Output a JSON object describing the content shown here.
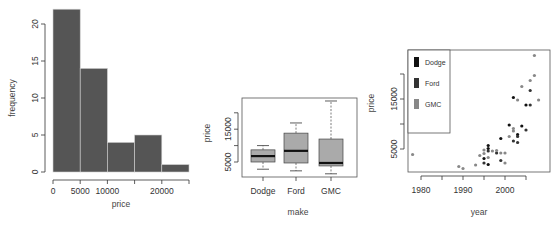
{
  "chart_data": [
    {
      "type": "bar",
      "subtype": "histogram",
      "title": "",
      "xlabel": "price",
      "ylabel": "frequency",
      "bins": [
        [
          0,
          5000
        ],
        [
          5000,
          10000
        ],
        [
          10000,
          15000
        ],
        [
          15000,
          20000
        ],
        [
          20000,
          25000
        ]
      ],
      "values": [
        22,
        14,
        4,
        5,
        1
      ],
      "xticks": [
        0,
        5000,
        10000,
        20000
      ],
      "xtick_marks": [
        0,
        5000,
        10000,
        15000,
        20000,
        25000
      ],
      "yticks": [
        0,
        5,
        10,
        15,
        20
      ],
      "xlim": [
        0,
        25000
      ],
      "ylim": [
        0,
        22
      ],
      "bar_color": "#555555",
      "grid": false
    },
    {
      "type": "boxplot",
      "title": "",
      "xlabel": "make",
      "ylabel": "price",
      "categories": [
        "Dodge",
        "Ford",
        "GMC"
      ],
      "boxes": [
        {
          "name": "Dodge",
          "whisker_low": 2800,
          "q1": 5000,
          "median": 6800,
          "q3": 8700,
          "whisker_high": 10000
        },
        {
          "name": "Ford",
          "whisker_low": 2300,
          "q1": 4700,
          "median": 8400,
          "q3": 13800,
          "whisker_high": 16900
        },
        {
          "name": "GMC",
          "whisker_low": 1400,
          "q1": 3800,
          "median": 4700,
          "q3": 12000,
          "whisker_high": 23600
        }
      ],
      "yticks_labeled": [
        5000,
        15000
      ],
      "ytick_marks": [
        5000,
        10000,
        15000,
        20000
      ],
      "box_color": "#aaaaaa",
      "grid": false
    },
    {
      "type": "scatter",
      "title": "",
      "xlabel": "year",
      "ylabel": "price",
      "xticks": [
        1980,
        1990,
        2000
      ],
      "xtick_marks": [
        1980,
        1985,
        1990,
        1995,
        2000,
        2005
      ],
      "yticks_labeled": [
        5000,
        15000
      ],
      "ytick_marks": [
        5000,
        10000,
        15000,
        20000
      ],
      "legend": {
        "position": "top-left",
        "entries": [
          "Dodge",
          "Ford",
          "GMC"
        ]
      },
      "series": [
        {
          "name": "Dodge",
          "color": "#111111",
          "points": [
            [
              1995,
              3100
            ],
            [
              1996,
              5700
            ],
            [
              1996,
              5100
            ],
            [
              1996,
              1900
            ],
            [
              1999,
              7100
            ],
            [
              2001,
              9800
            ],
            [
              2002,
              15300
            ],
            [
              2003,
              7900
            ],
            [
              2004,
              9600
            ],
            [
              2005,
              13800
            ]
          ]
        },
        {
          "name": "Ford",
          "color": "#333333",
          "points": [
            [
              1995,
              2200
            ],
            [
              1996,
              4600
            ],
            [
              1998,
              4200
            ],
            [
              1999,
              2700
            ],
            [
              2002,
              6600
            ],
            [
              2003,
              7500
            ],
            [
              2003,
              6300
            ],
            [
              2005,
              8800
            ],
            [
              2006,
              13800
            ],
            [
              2006,
              16700
            ]
          ]
        },
        {
          "name": "GMC",
          "color": "#888888",
          "points": [
            [
              1978,
              3900
            ],
            [
              1989,
              1500
            ],
            [
              1990,
              1100
            ],
            [
              1993,
              1800
            ],
            [
              1994,
              3700
            ],
            [
              1995,
              4800
            ],
            [
              1995,
              4100
            ],
            [
              1996,
              3300
            ],
            [
              1997,
              4600
            ],
            [
              1998,
              4700
            ],
            [
              1999,
              4200
            ],
            [
              2000,
              4200
            ],
            [
              2000,
              2200
            ],
            [
              2001,
              7500
            ],
            [
              2002,
              9100
            ],
            [
              2002,
              8600
            ],
            [
              2003,
              14800
            ],
            [
              2004,
              17500
            ],
            [
              2006,
              18700
            ],
            [
              2007,
              19700
            ],
            [
              2007,
              23700
            ],
            [
              2008,
              14800
            ]
          ]
        }
      ],
      "grid": false
    }
  ],
  "labels": {
    "hist": {
      "xlabel": "price",
      "ylabel": "frequency",
      "xticks": [
        "0",
        "5000",
        "10000",
        "20000"
      ],
      "yticks": [
        "0",
        "5",
        "10",
        "15",
        "20"
      ]
    },
    "box": {
      "xlabel": "make",
      "ylabel": "price",
      "xticks": [
        "Dodge",
        "Ford",
        "GMC"
      ],
      "yticks": [
        "5000",
        "15000"
      ]
    },
    "scatter": {
      "xlabel": "year",
      "ylabel": "price",
      "xticks": [
        "1980",
        "1990",
        "2000"
      ],
      "yticks": [
        "5000",
        "15000"
      ],
      "legend": [
        "Dodge",
        "Ford",
        "GMC"
      ]
    }
  }
}
